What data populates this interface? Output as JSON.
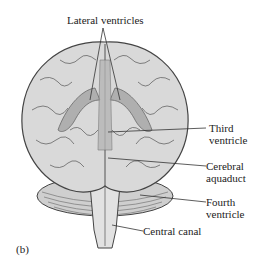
{
  "figure": {
    "panel_label": "(b)",
    "labels": {
      "lateral_ventricles": "Lateral ventricles",
      "third_ventricle_line1": "Third",
      "third_ventricle_line2": "ventricle",
      "cerebral_aquaduct_line1": "Cerebral",
      "cerebral_aquaduct_line2": "aquaduct",
      "fourth_ventricle_line1": "Fourth",
      "fourth_ventricle_line2": "ventricle",
      "central_canal": "Central canal"
    },
    "colors": {
      "brain_fill": "#d9d9d9",
      "ventricle_fill": "#a8a8a8",
      "outline": "#444444",
      "leader_line": "#333333"
    }
  }
}
